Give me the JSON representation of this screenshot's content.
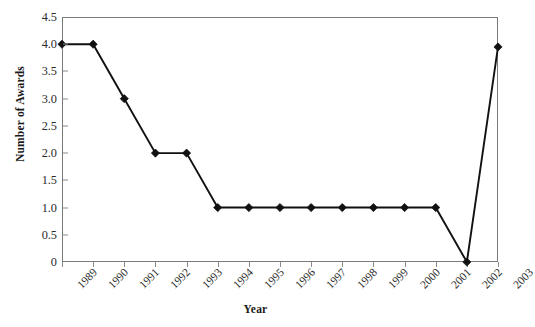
{
  "chart_data": {
    "type": "line",
    "title": "",
    "xlabel": "Year",
    "ylabel": "Number of Awards",
    "categories": [
      "1989",
      "1990",
      "1991",
      "1992",
      "1993",
      "1994",
      "1995",
      "1996",
      "1997",
      "1998",
      "1999",
      "2000",
      "2001",
      "2002",
      "2003"
    ],
    "values": [
      4,
      4,
      3,
      2,
      2,
      1,
      1,
      1,
      1,
      1,
      1,
      1,
      1,
      0,
      3.95
    ],
    "series": [
      {
        "name": "Number of Awards",
        "values": [
          4,
          4,
          3,
          2,
          2,
          1,
          1,
          1,
          1,
          1,
          1,
          1,
          1,
          0,
          3.95
        ]
      }
    ],
    "ylim": [
      0,
      4.5
    ],
    "ytick_labels": [
      "4.5",
      "4.0",
      "3.5",
      "3.0",
      "2.5",
      "2.0",
      "1.5",
      "1.0",
      "0.5",
      "0"
    ],
    "ytick_values": [
      4.5,
      4.0,
      3.5,
      3.0,
      2.5,
      2.0,
      1.5,
      1.0,
      0.5,
      0
    ],
    "grid": false,
    "legend": false,
    "legend_position": "none",
    "marker": "diamond",
    "line_color": "#111111",
    "marker_color": "#111111",
    "axis_color": "#7a7a7a",
    "background_color": "#ffffff",
    "xtick_rotation": -45
  }
}
